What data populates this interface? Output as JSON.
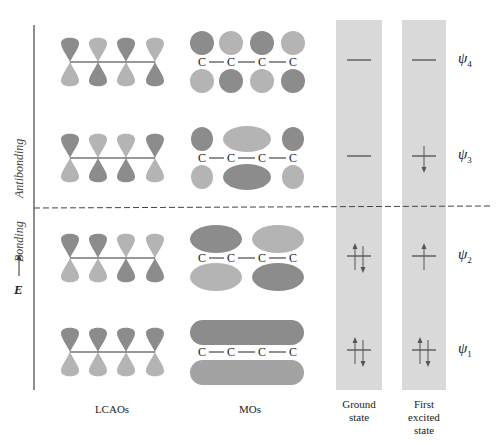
{
  "figure": {
    "axis": {
      "energy_label": "E",
      "arrow": "up-arrow"
    },
    "regions": {
      "antibonding_label": "Antibonding",
      "bonding_label": "Bonding"
    },
    "columns": {
      "lcao_label": "LCAOs",
      "mo_label": "MOs",
      "ground_label_line1": "Ground",
      "ground_label_line2": "state",
      "excited_label_line1": "First",
      "excited_label_line2": "excited",
      "excited_label_line3": "state"
    },
    "atom_symbol": "C",
    "orbitals": [
      {
        "name": "psi4",
        "symbol": "ψ",
        "index": "4",
        "type": "antibonding",
        "ground": "empty",
        "excited": "empty",
        "lcao_top_shades": [
          "dark",
          "light",
          "dark",
          "light"
        ],
        "mo_shape": "four-separate"
      },
      {
        "name": "psi3",
        "symbol": "ψ",
        "index": "3",
        "type": "antibonding",
        "ground": "empty",
        "excited": "one-down",
        "lcao_top_shades": [
          "dark",
          "light",
          "light",
          "dark"
        ],
        "mo_shape": "end-center-end"
      },
      {
        "name": "psi2",
        "symbol": "ψ",
        "index": "2",
        "type": "bonding",
        "ground": "paired",
        "excited": "one-up",
        "lcao_top_shades": [
          "dark",
          "dark",
          "light",
          "light"
        ],
        "mo_shape": "two-lobes"
      },
      {
        "name": "psi1",
        "symbol": "ψ",
        "index": "1",
        "type": "bonding",
        "ground": "paired",
        "excited": "paired",
        "lcao_top_shades": [
          "dark",
          "dark",
          "dark",
          "dark"
        ],
        "mo_shape": "one-lobe"
      }
    ],
    "colors": {
      "dark_lobe": "#8c8c8c",
      "light_lobe": "#b4b4b4",
      "state_band": "#d9d9d9",
      "line": "#333333",
      "background": "#ffffff"
    }
  }
}
